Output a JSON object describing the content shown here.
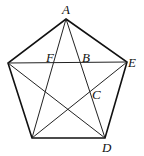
{
  "figure": {
    "type": "regular pentagon with all diagonals (pentagram)",
    "vertices": {
      "A": [
        66,
        19
      ],
      "E": [
        127,
        62
      ],
      "D": [
        105,
        138
      ],
      "P4": [
        32,
        138
      ],
      "P5": [
        8,
        63
      ]
    },
    "labels": [
      {
        "text": "A",
        "x": 62,
        "y": 14
      },
      {
        "text": "F",
        "x": 46,
        "y": 62
      },
      {
        "text": "B",
        "x": 82,
        "y": 62
      },
      {
        "text": "E",
        "x": 128,
        "y": 67
      },
      {
        "text": "C",
        "x": 92,
        "y": 99
      },
      {
        "text": "D",
        "x": 102,
        "y": 152
      }
    ]
  }
}
